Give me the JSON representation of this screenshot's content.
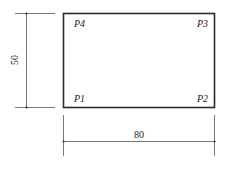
{
  "diagram": {
    "type": "dimensioned-rectangle",
    "rectangle": {
      "width_label": "80",
      "height_label": "50",
      "stroke_color": "#2a2a2a",
      "dimension_color": "#555555"
    },
    "points": [
      {
        "id": "P1",
        "label": "P1",
        "position": "bottom-left"
      },
      {
        "id": "P2",
        "label": "P2",
        "position": "bottom-right"
      },
      {
        "id": "P3",
        "label": "P3",
        "position": "top-right"
      },
      {
        "id": "P4",
        "label": "P4",
        "position": "top-left"
      }
    ],
    "dimensions": {
      "horizontal": {
        "value": "80",
        "side": "bottom"
      },
      "vertical": {
        "value": "50",
        "side": "left"
      }
    }
  }
}
